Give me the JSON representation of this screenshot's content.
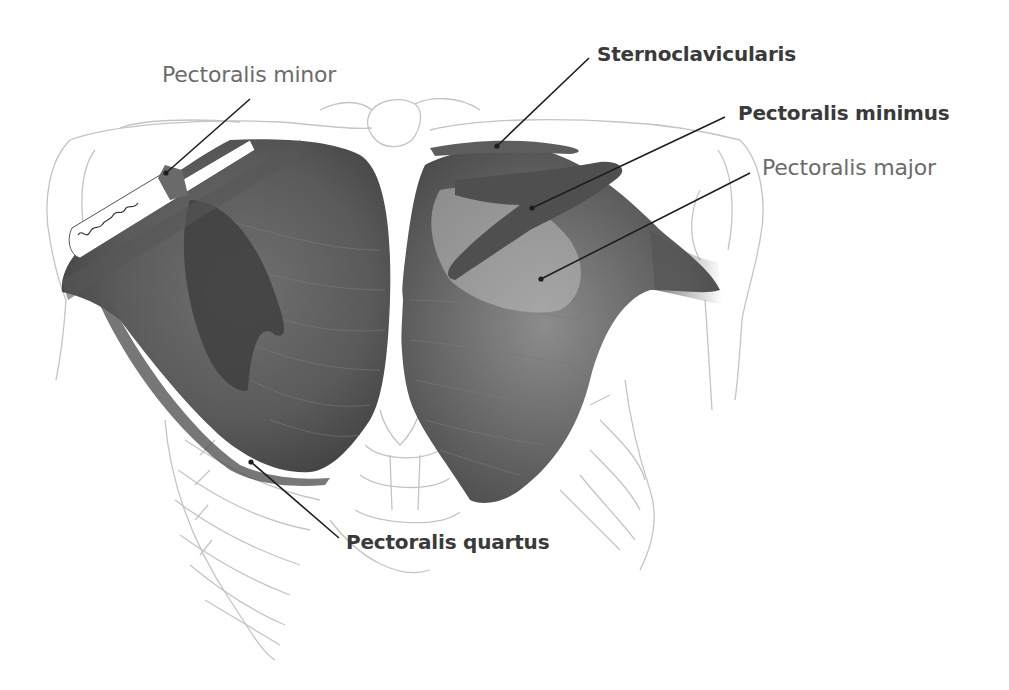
{
  "figure": {
    "signature": "artist signature"
  },
  "labels": [
    {
      "id": "pectoralis-minor",
      "text": "Pectoralis minor",
      "weight": "regular",
      "x": 162,
      "y": 64,
      "line": [
        250,
        99,
        166,
        173
      ]
    },
    {
      "id": "sternoclavicularis",
      "text": "Sternoclavicularis",
      "weight": "bold",
      "x": 597,
      "y": 44,
      "line": [
        589,
        58,
        497,
        146
      ]
    },
    {
      "id": "pectoralis-minimus",
      "text": "Pectoralis minimus",
      "weight": "bold",
      "x": 738,
      "y": 103,
      "line": [
        725,
        117,
        532,
        208
      ]
    },
    {
      "id": "pectoralis-major",
      "text": "Pectoralis major",
      "weight": "regular",
      "x": 762,
      "y": 157,
      "line": [
        750,
        173,
        541,
        279
      ]
    },
    {
      "id": "pectoralis-quartus",
      "text": "Pectoralis quartus",
      "weight": "bold",
      "x": 346,
      "y": 532,
      "line": [
        339,
        538,
        251,
        462
      ]
    }
  ],
  "colors": {
    "background": "#ffffff",
    "muscle_dark": "#4a4a4a",
    "muscle_mid": "#6e6e6e",
    "bone_outline": "#c4c4c4",
    "leader_line": "#1e1e1e",
    "label_regular": "#6b6b6b",
    "label_bold": "#3a3a3a"
  }
}
